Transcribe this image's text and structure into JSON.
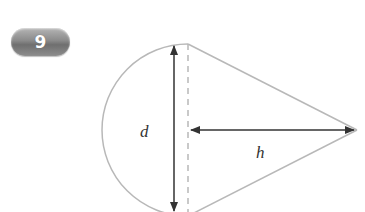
{
  "badge": {
    "number": "9"
  },
  "diagram": {
    "shape": "cone cross-section with semicircular base",
    "labels": {
      "diameter": "d",
      "height": "h"
    },
    "colors": {
      "outline": "#b8b8b8",
      "arrow": "#333333",
      "dashed": "#b8b8b8"
    }
  }
}
